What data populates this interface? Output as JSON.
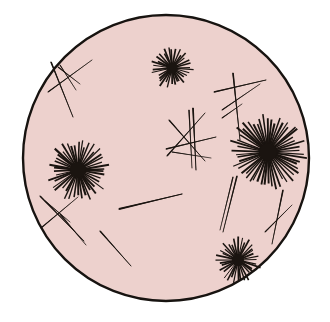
{
  "figure": {
    "canvas": {
      "width": 330,
      "height": 322
    },
    "background_color": "#ffffff"
  },
  "field": {
    "name": "circular microscopy field",
    "center_x": 166,
    "center_y": 158,
    "radius": 143,
    "fill_color": "#edd1cd",
    "stroke_color": "#171310",
    "stroke_width": 2.4
  },
  "crystal_color": "#1a1410",
  "starbursts": [
    {
      "label": "top starburst spherulite",
      "cx": 172,
      "cy": 68,
      "radius": 22,
      "core_radius": 5.5,
      "spikes": 34,
      "rotation": 6,
      "jitter": 0.34,
      "length_var": 0.34,
      "width": 1.5
    },
    {
      "label": "left starburst spherulite",
      "cx": 78,
      "cy": 170,
      "radius": 32,
      "core_radius": 8,
      "spikes": 46,
      "rotation": 12,
      "jitter": 0.3,
      "length_var": 0.3,
      "width": 1.7
    },
    {
      "label": "right large starburst spherulite",
      "cx": 268,
      "cy": 152,
      "radius": 40,
      "core_radius": 9,
      "spikes": 54,
      "rotation": 3,
      "jitter": 0.26,
      "length_var": 0.28,
      "width": 1.7
    },
    {
      "label": "bottom right starburst spherulite",
      "cx": 238,
      "cy": 260,
      "radius": 24,
      "core_radius": 6,
      "spikes": 36,
      "rotation": 20,
      "jitter": 0.32,
      "length_var": 0.32,
      "width": 1.5
    }
  ],
  "needles": [
    {
      "label": "top-left long needle",
      "x1": 51,
      "y1": 62,
      "x2": 73,
      "y2": 117,
      "width": 1.5
    },
    {
      "label": "top-left crossing needle",
      "x1": 48,
      "y1": 92,
      "x2": 92,
      "y2": 60,
      "width": 1.3
    },
    {
      "label": "top-left short needle",
      "x1": 58,
      "y1": 67,
      "x2": 80,
      "y2": 84,
      "width": 1.1
    },
    {
      "label": "top-left fine needle",
      "x1": 60,
      "y1": 65,
      "x2": 76,
      "y2": 90,
      "width": 0.9
    },
    {
      "label": "center needle rising right",
      "x1": 167,
      "y1": 156,
      "x2": 205,
      "y2": 113,
      "width": 1.4
    },
    {
      "label": "center needle falling right",
      "x1": 169,
      "y1": 120,
      "x2": 205,
      "y2": 161,
      "width": 1.4
    },
    {
      "label": "center vertical needle",
      "x1": 193,
      "y1": 108,
      "x2": 196,
      "y2": 170,
      "width": 1.6
    },
    {
      "label": "center vertical needle twin",
      "x1": 189,
      "y1": 110,
      "x2": 192,
      "y2": 168,
      "width": 1.2
    },
    {
      "label": "center horizontal needle",
      "x1": 166,
      "y1": 149,
      "x2": 216,
      "y2": 137,
      "width": 1.3
    },
    {
      "label": "center lower cross needle",
      "x1": 172,
      "y1": 152,
      "x2": 211,
      "y2": 158,
      "width": 1.1
    },
    {
      "label": "top-right horizontal needle",
      "x1": 214,
      "y1": 92,
      "x2": 266,
      "y2": 80,
      "width": 1.4
    },
    {
      "label": "top-right vertical needle",
      "x1": 233,
      "y1": 73,
      "x2": 240,
      "y2": 140,
      "width": 1.5
    },
    {
      "label": "top-right diagonal needle",
      "x1": 222,
      "y1": 110,
      "x2": 260,
      "y2": 84,
      "width": 1.2
    },
    {
      "label": "top-right short needle",
      "x1": 222,
      "y1": 118,
      "x2": 242,
      "y2": 104,
      "width": 1.1
    },
    {
      "label": "center long tapered needle",
      "x1": 119,
      "y1": 209,
      "x2": 182,
      "y2": 194,
      "width": 2.1
    },
    {
      "label": "bottom-left needle descending",
      "x1": 40,
      "y1": 196,
      "x2": 84,
      "y2": 241,
      "width": 1.5
    },
    {
      "label": "bottom-left crossing needle",
      "x1": 41,
      "y1": 228,
      "x2": 78,
      "y2": 197,
      "width": 1.2
    },
    {
      "label": "bottom-left lower needle",
      "x1": 60,
      "y1": 214,
      "x2": 86,
      "y2": 245,
      "width": 1.2
    },
    {
      "label": "bottom-left fine needle",
      "x1": 45,
      "y1": 201,
      "x2": 70,
      "y2": 222,
      "width": 0.9
    },
    {
      "label": "bottom-center needle",
      "x1": 100,
      "y1": 231,
      "x2": 131,
      "y2": 266,
      "width": 1.5
    },
    {
      "label": "right descending needle",
      "x1": 237,
      "y1": 176,
      "x2": 223,
      "y2": 232,
      "width": 1.4
    },
    {
      "label": "right descending needle twin",
      "x1": 233,
      "y1": 177,
      "x2": 220,
      "y2": 230,
      "width": 1.1
    },
    {
      "label": "far-right vertical needle",
      "x1": 283,
      "y1": 190,
      "x2": 272,
      "y2": 244,
      "width": 1.4
    },
    {
      "label": "far-right crossing needle",
      "x1": 265,
      "y1": 232,
      "x2": 292,
      "y2": 205,
      "width": 1.2
    }
  ]
}
